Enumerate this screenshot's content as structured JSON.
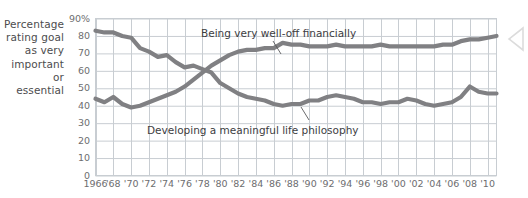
{
  "axis": {
    "y_title_lines": [
      "Percentage",
      "rating goal",
      "as very",
      "important",
      "or",
      "essential"
    ],
    "y_ticks": [
      "90%",
      "80",
      "70",
      "60",
      "50",
      "40",
      "30",
      "20",
      "10",
      "0"
    ],
    "x_ticks": [
      "1966",
      "'68",
      "'70",
      "'72",
      "'74",
      "'76",
      "'78",
      "'80",
      "'82",
      "'84",
      "'86",
      "'88",
      "'90",
      "'92",
      "'94",
      "'96",
      "'98",
      "'00",
      "'02",
      "'04",
      "'06",
      "'08",
      "'10"
    ]
  },
  "annotations": {
    "wealth_label": "Being very well-off financially",
    "philosophy_label": "Developing a meaningful life philosophy"
  },
  "colors": {
    "line": "#808083",
    "grid": "#c8cdd2",
    "axis_text": "#6d6d6f",
    "label_text": "#3d3d3f",
    "background": "#ffffff"
  },
  "chart_data": {
    "type": "line",
    "title": "",
    "xlabel": "",
    "ylabel": "Percentage rating goal as very important or essential",
    "ylim": [
      0,
      90
    ],
    "xlim": [
      1966,
      2011
    ],
    "grid": true,
    "legend": "annotated-inline",
    "x": [
      1966,
      1967,
      1968,
      1969,
      1970,
      1971,
      1972,
      1973,
      1974,
      1975,
      1976,
      1977,
      1978,
      1979,
      1980,
      1981,
      1982,
      1983,
      1984,
      1985,
      1986,
      1987,
      1988,
      1989,
      1990,
      1991,
      1992,
      1993,
      1994,
      1995,
      1996,
      1997,
      1998,
      1999,
      2000,
      2001,
      2002,
      2003,
      2004,
      2005,
      2006,
      2007,
      2008,
      2009,
      2010,
      2011
    ],
    "series": [
      {
        "name": "Developing a meaningful life philosophy",
        "color": "#808083",
        "values": [
          83,
          82,
          82,
          80,
          79,
          73,
          71,
          68,
          69,
          65,
          62,
          63,
          61,
          59,
          53,
          50,
          47,
          45,
          44,
          43,
          41,
          40,
          41,
          41,
          43,
          43,
          45,
          46,
          45,
          44,
          42,
          42,
          41,
          42,
          42,
          44,
          43,
          41,
          40,
          41,
          42,
          45,
          51,
          48,
          47,
          47
        ]
      },
      {
        "name": "Being very well-off financially",
        "color": "#808083",
        "values": [
          44,
          42,
          45,
          41,
          39,
          40,
          42,
          44,
          46,
          48,
          51,
          55,
          59,
          63,
          66,
          69,
          71,
          72,
          72,
          73,
          73,
          76,
          75,
          75,
          74,
          74,
          74,
          75,
          74,
          74,
          74,
          74,
          75,
          74,
          74,
          74,
          74,
          74,
          74,
          75,
          75,
          77,
          78,
          78,
          79,
          80
        ]
      }
    ],
    "note": "x-axis labeled every 2 years from 1966 to '10"
  }
}
